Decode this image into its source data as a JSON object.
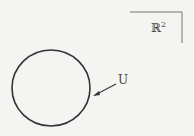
{
  "diagram": {
    "space_label": "ℝ",
    "space_exponent": "2",
    "set_label": "U",
    "colors": {
      "stroke": "#333333",
      "frame": "#777777",
      "text": "#444444",
      "background": "#f4f4f2"
    }
  }
}
